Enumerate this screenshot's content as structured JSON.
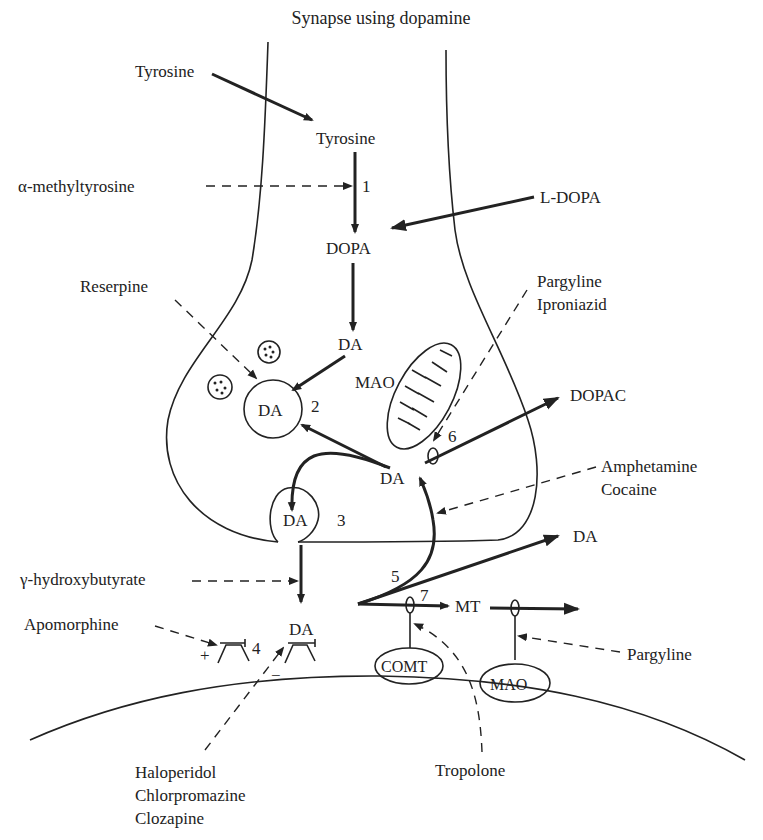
{
  "title": "Synapse using dopamine",
  "labels": {
    "tyrosine_outside": "Tyrosine",
    "tyrosine_inside": "Tyrosine",
    "alpha_methyltyrosine": "α-methyltyrosine",
    "l_dopa": "L-DOPA",
    "dopa": "DOPA",
    "reserpine": "Reserpine",
    "pargyline_top": "Pargyline",
    "iproniazid": "Iproniazid",
    "da_cytosol": "DA",
    "da_vesicle": "DA",
    "mao_mito": "MAO",
    "dopac": "DOPAC",
    "da_free": "DA",
    "amphetamine": "Amphetamine",
    "cocaine": "Cocaine",
    "da_release_vesicle": "DA",
    "gamma_hydroxybutyrate": "γ-hydroxybutyrate",
    "da_cleft_out": "DA",
    "apomorphine": "Apomorphine",
    "da_receptor": "DA",
    "plus": "+",
    "minus": "−",
    "mt": "MT",
    "comt": "COMT",
    "mao_post": "MAO",
    "pargyline_bottom": "Pargyline",
    "tropolone": "Tropolone",
    "haloperidol": "Haloperidol",
    "chlorpromazine": "Chlorpromazine",
    "clozapine": "Clozapine"
  },
  "steps": {
    "s1": "1",
    "s2": "2",
    "s3": "3",
    "s4": "4",
    "s5": "5",
    "s6": "6",
    "s7": "7"
  }
}
